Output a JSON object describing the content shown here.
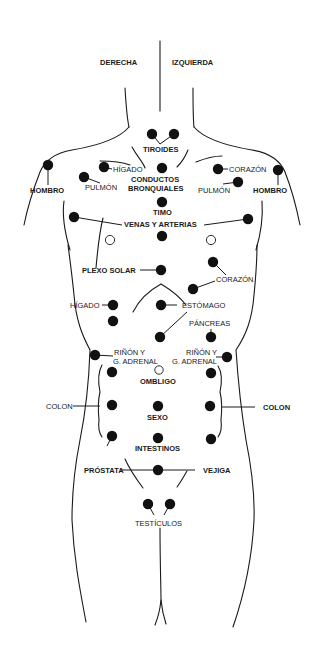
{
  "diagram": {
    "type": "body-reflex-points",
    "orientation": {
      "right_side_label": "DERECHA",
      "left_side_label": "IZQUIERDA"
    },
    "labels": {
      "tiroides": "TIROIDES",
      "higado_upper": "HÍGADO",
      "conductos": "CONDUCTOS",
      "bronquiales": "BRONQUIALES",
      "corazon_upper": "CORAZÓN",
      "hombro_right": "HOMBRO",
      "hombro_left": "HOMBRO",
      "pulmon_right": "PULMÓN",
      "pulmon_left": "PULMÓN",
      "timo": "TIMO",
      "venas_arterias": "VENAS Y ARTERIAS",
      "plexo_solar": "PLEXO SOLAR",
      "corazon_lower": "CORAZÓN",
      "higado_lower": "HÍGADO",
      "estomago": "ESTÓMAGO",
      "pancreas": "PÁNCREAS",
      "rinon_right_1": "RIÑÓN Y",
      "rinon_right_2": "G. ADRENAL",
      "rinon_left_1": "RIÑÓN Y",
      "rinon_left_2": "G. ADRENAL",
      "ombligo": "OMBLIGO",
      "colon_right": "COLON",
      "colon_left": "COLON",
      "sexo": "SEXO",
      "intestinos": "INTESTINOS",
      "prostata": "PRÓSTATA",
      "vejiga": "VEJIGA",
      "testiculos": "TESTÍCULOS"
    },
    "points": [
      {
        "organ": "TIROIDES",
        "x": 152,
        "y": 134
      },
      {
        "organ": "TIROIDES",
        "x": 174,
        "y": 134
      },
      {
        "organ": "HÍGADO",
        "x": 104,
        "y": 167
      },
      {
        "organ": "CONDUCTOS BRONQUIALES",
        "x": 162,
        "y": 168
      },
      {
        "organ": "CORAZÓN",
        "x": 218,
        "y": 169
      },
      {
        "organ": "HOMBRO",
        "x": 48,
        "y": 165
      },
      {
        "organ": "HOMBRO",
        "x": 278,
        "y": 170
      },
      {
        "organ": "PULMÓN",
        "x": 84,
        "y": 177
      },
      {
        "organ": "PULMÓN",
        "x": 238,
        "y": 182
      },
      {
        "organ": "TIMO",
        "x": 162,
        "y": 202
      },
      {
        "organ": "VENAS Y ARTERIAS",
        "x": 74,
        "y": 217
      },
      {
        "organ": "VENAS Y ARTERIAS",
        "x": 248,
        "y": 219
      },
      {
        "organ": "VENAS Y ARTERIAS",
        "x": 162,
        "y": 236
      },
      {
        "organ": "PLEXO SOLAR",
        "x": 161,
        "y": 270
      },
      {
        "organ": "CORAZÓN",
        "x": 213,
        "y": 262
      },
      {
        "organ": "CORAZÓN",
        "x": 193,
        "y": 289
      },
      {
        "organ": "HÍGADO",
        "x": 113,
        "y": 305
      },
      {
        "organ": "HÍGADO",
        "x": 113,
        "y": 321
      },
      {
        "organ": "ESTÓMAGO",
        "x": 161,
        "y": 305
      },
      {
        "organ": "PÁNCREAS",
        "x": 160,
        "y": 337
      },
      {
        "organ": "PÁNCREAS",
        "x": 211,
        "y": 337
      },
      {
        "organ": "RIÑÓN Y G. ADRENAL",
        "x": 95,
        "y": 355
      },
      {
        "organ": "RIÑÓN Y G. ADRENAL",
        "x": 227,
        "y": 357
      },
      {
        "organ": "COLON",
        "x": 112,
        "y": 372
      },
      {
        "organ": "COLON",
        "x": 211,
        "y": 373
      },
      {
        "organ": "COLON",
        "x": 112,
        "y": 405
      },
      {
        "organ": "SEXO",
        "x": 158,
        "y": 406
      },
      {
        "organ": "COLON",
        "x": 210,
        "y": 406
      },
      {
        "organ": "INTESTINOS",
        "x": 112,
        "y": 436
      },
      {
        "organ": "INTESTINOS",
        "x": 158,
        "y": 438
      },
      {
        "organ": "INTESTINOS",
        "x": 211,
        "y": 439
      },
      {
        "organ": "PRÓSTATA / VEJIGA",
        "x": 158,
        "y": 470
      },
      {
        "organ": "TESTÍCULOS",
        "x": 148,
        "y": 504
      },
      {
        "organ": "TESTÍCULOS",
        "x": 170,
        "y": 504
      }
    ],
    "hollow_points": [
      {
        "organ": "unlabeled",
        "x": 110,
        "y": 240
      },
      {
        "organ": "unlabeled",
        "x": 211,
        "y": 240
      },
      {
        "organ": "OMBLIGO",
        "x": 159,
        "y": 370
      }
    ]
  }
}
